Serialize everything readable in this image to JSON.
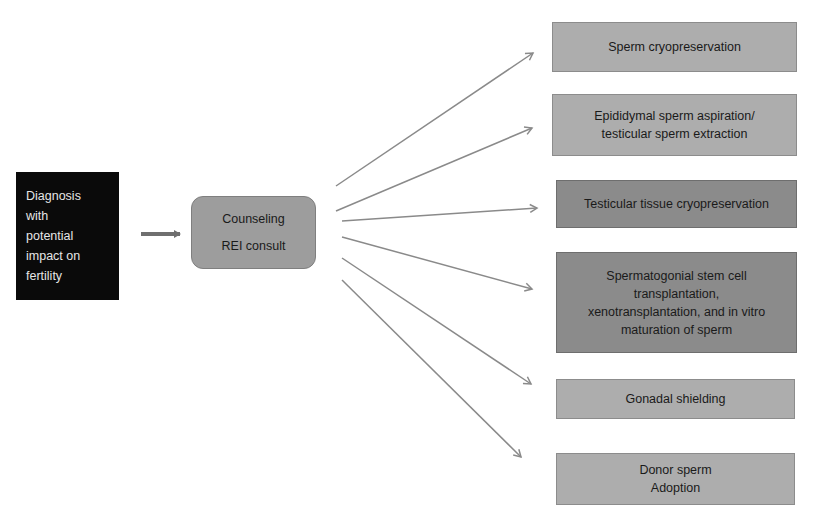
{
  "diagram": {
    "source": {
      "lines": [
        "Diagnosis",
        "with",
        "potential",
        "impact on",
        "fertility"
      ]
    },
    "counseling": {
      "lines": [
        "Counseling",
        "REI consult"
      ]
    },
    "options": [
      {
        "lines": [
          "Sperm cryopreservation"
        ],
        "shade": "light"
      },
      {
        "lines": [
          "Epididymal sperm aspiration/",
          "testicular sperm extraction"
        ],
        "shade": "light"
      },
      {
        "lines": [
          "Testicular tissue cryopreservation"
        ],
        "shade": "dark"
      },
      {
        "lines": [
          "Spermatogonial stem cell",
          "transplantation,",
          "xenotransplantation, and in vitro",
          "maturation of sperm"
        ],
        "shade": "dark"
      },
      {
        "lines": [
          "Gonadal shielding"
        ],
        "shade": "light"
      },
      {
        "lines": [
          "Donor sperm",
          "Adoption"
        ],
        "shade": "light"
      }
    ],
    "colors": {
      "source_bg": "#0a0a0a",
      "counseling_bg": "#9d9d9d",
      "option_light_bg": "#adadad",
      "option_dark_bg": "#8b8b8b",
      "arrow": "#8a8a8a",
      "main_arrow": "#6f6f6f"
    }
  }
}
